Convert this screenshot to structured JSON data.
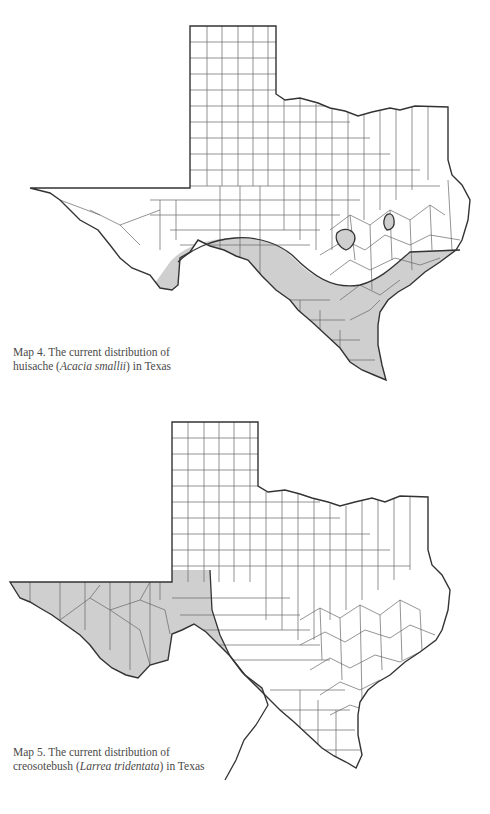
{
  "maps": [
    {
      "id": "map4",
      "caption_line1": "Map 4. The current distribution of",
      "caption_line2_prefix": "huisache (",
      "caption_species": "Acacia smallii",
      "caption_line2_suffix": ") in Texas",
      "region": "Texas",
      "common_name": "huisache",
      "shaded_area": "South Texas, Rio Grande plains and Gulf Coast, plus two isolated patches in central Texas"
    },
    {
      "id": "map5",
      "caption_line1": "Map 5. The current distribution of",
      "caption_line2_prefix": "creosotebush (",
      "caption_species": "Larrea tridentata",
      "caption_line2_suffix": ") in Texas",
      "region": "Texas",
      "common_name": "creosotebush",
      "shaded_area": "Trans-Pecos / far west Texas extending southeast along the Rio Grande"
    }
  ],
  "colors": {
    "outline": "#333333",
    "county_line": "#555555",
    "shade": "#cfcfcf",
    "background": "#ffffff"
  }
}
